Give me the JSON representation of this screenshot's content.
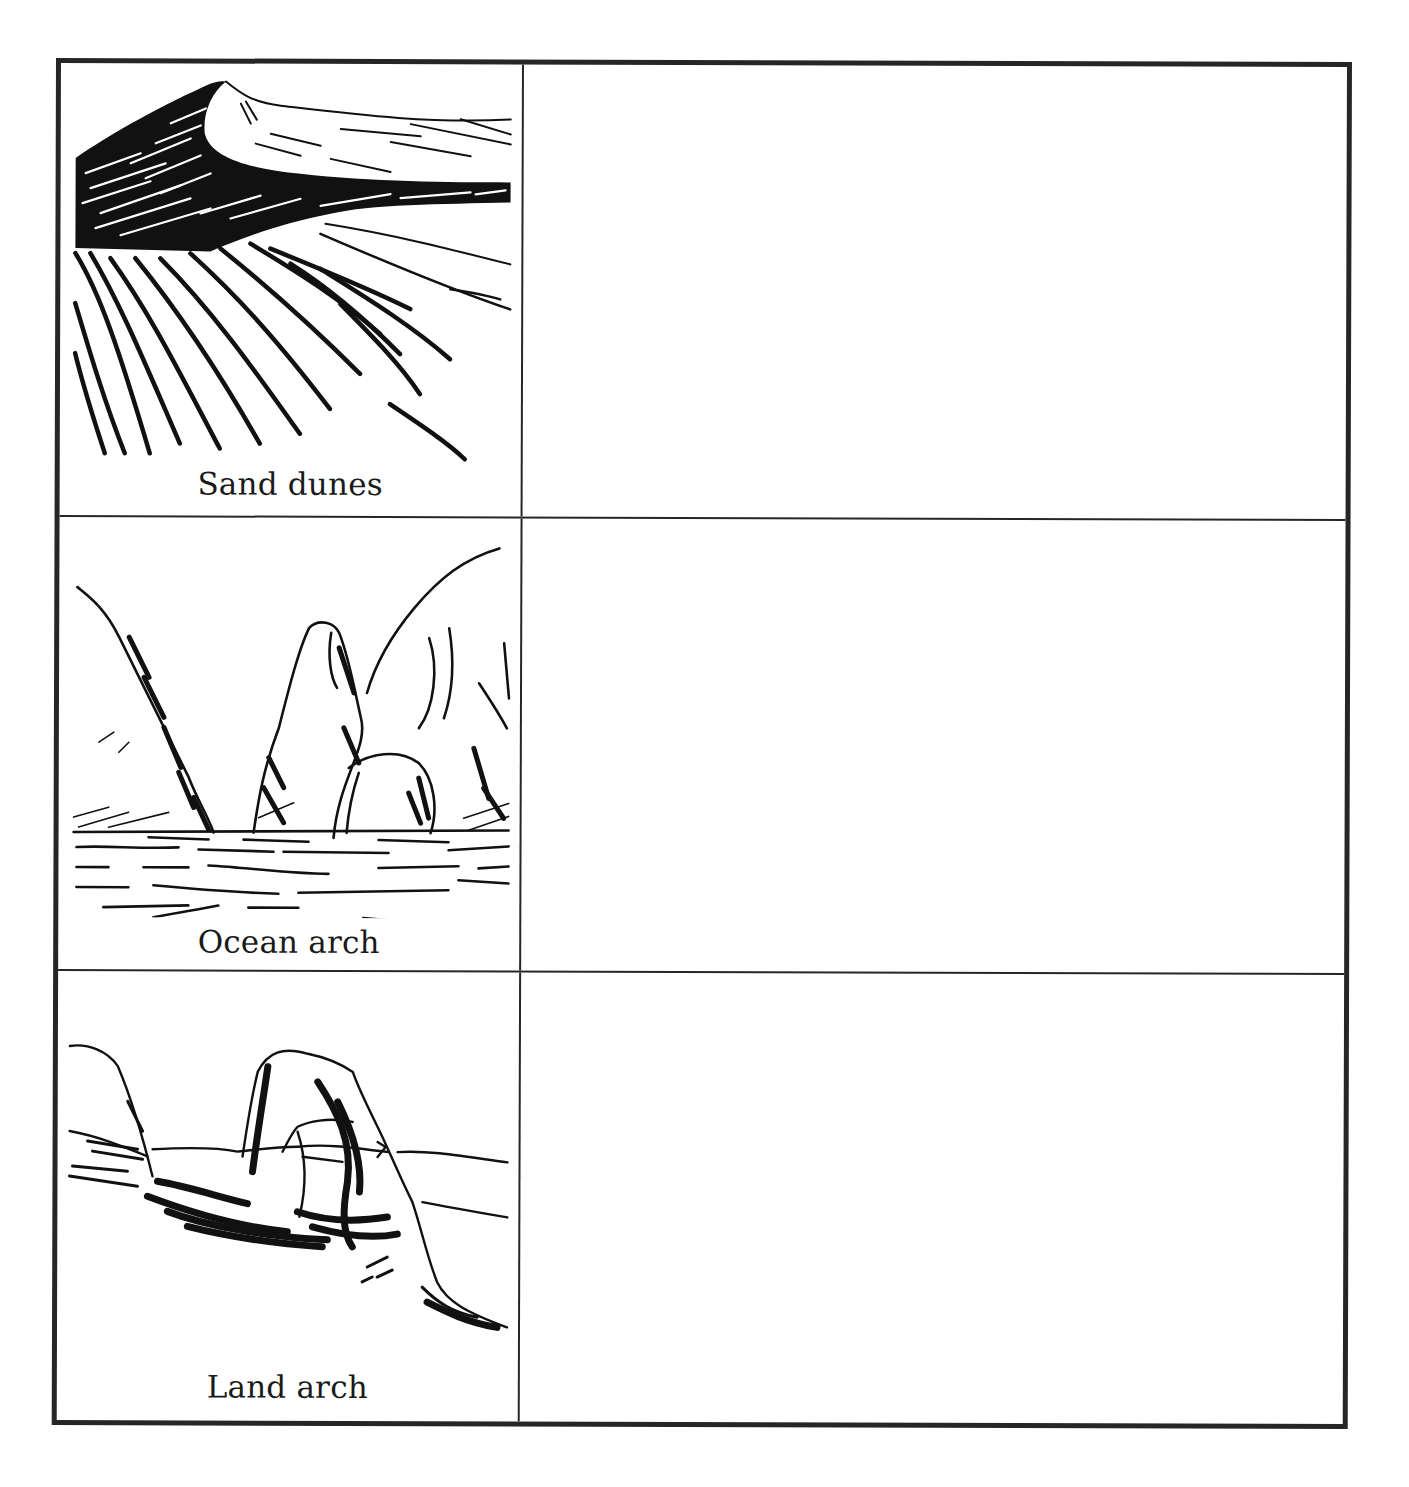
{
  "worksheet": {
    "layout": "two-column table, 3 rows; left column holds a captioned line-art illustration, right column is an empty answer area",
    "border_color": "#262626",
    "background_color": "#ffffff",
    "rows": [
      {
        "label": "Sand dunes",
        "illustration": "sand-dunes-drawing",
        "answer_text": ""
      },
      {
        "label": "Ocean arch",
        "illustration": "ocean-arch-drawing",
        "answer_text": ""
      },
      {
        "label": "Land arch",
        "illustration": "land-arch-drawing",
        "answer_text": ""
      }
    ]
  }
}
